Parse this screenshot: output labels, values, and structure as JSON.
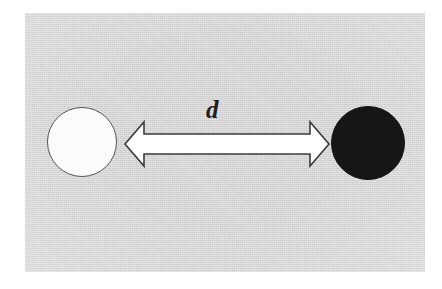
{
  "figure": {
    "kind": "physics-distance-diagram",
    "canvas": {
      "width": 442,
      "height": 289
    },
    "background_color": "#ffffff",
    "panel": {
      "fill_color": "#d2d2d2",
      "x": 25,
      "y": 13,
      "width": 400,
      "height": 259
    }
  },
  "objects": {
    "left_body": {
      "name": "white-sphere",
      "fill_color": "#fbfbfa",
      "stroke_color": "#555555",
      "center_x": 82,
      "center_y": 142,
      "diameter": 70
    },
    "right_body": {
      "name": "black-sphere",
      "fill_color": "#161616",
      "stroke_color": "#141414",
      "center_x": 368,
      "center_y": 143,
      "diameter": 74
    }
  },
  "annotation": {
    "distance_arrow": {
      "name": "double-headed-arrow",
      "fill_color": "#ffffff",
      "stroke_color": "#3b3b3b",
      "start_x": 125,
      "end_x": 332,
      "axis_y": 144,
      "shaft_top": 134,
      "shaft_bottom": 153,
      "head_top": 122,
      "head_bottom": 166
    },
    "distance_label": {
      "name": "distance-label",
      "text": "d",
      "style": "italic-serif",
      "color": "#1d1d1d",
      "x": 218,
      "y": 113
    }
  }
}
